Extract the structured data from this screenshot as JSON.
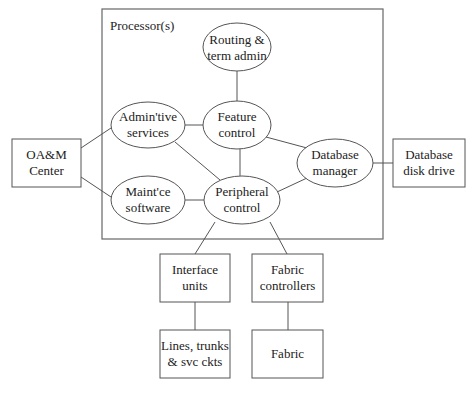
{
  "diagram": {
    "container": {
      "label": "Processor(s)"
    },
    "nodes": {
      "routing": {
        "line1": "Routing &",
        "line2": "term admin",
        "shape": "ellipse"
      },
      "admin": {
        "line1": "Admin'tive",
        "line2": "services",
        "shape": "ellipse"
      },
      "feature": {
        "line1": "Feature",
        "line2": "control",
        "shape": "ellipse"
      },
      "maint": {
        "line1": "Maint'ce",
        "line2": "software",
        "shape": "ellipse"
      },
      "peripheral": {
        "line1": "Peripheral",
        "line2": "control",
        "shape": "ellipse"
      },
      "dbmanager": {
        "line1": "Database",
        "line2": "manager",
        "shape": "ellipse"
      },
      "oam": {
        "line1": "OA&M",
        "line2": "Center",
        "shape": "box"
      },
      "diskdrive": {
        "line1": "Database",
        "line2": "disk drive",
        "shape": "box"
      },
      "interface": {
        "line1": "Interface",
        "line2": "units",
        "shape": "box"
      },
      "fabriccontrollers": {
        "line1": "Fabric",
        "line2": "controllers",
        "shape": "box"
      },
      "lines": {
        "line1": "Lines, trunks",
        "line2": "& svc ckts",
        "shape": "box"
      },
      "fabric": {
        "line1": "Fabric",
        "shape": "box"
      }
    },
    "edges": [
      [
        "routing",
        "feature"
      ],
      [
        "admin",
        "feature"
      ],
      [
        "admin",
        "peripheral"
      ],
      [
        "feature",
        "peripheral"
      ],
      [
        "feature",
        "dbmanager"
      ],
      [
        "maint",
        "peripheral"
      ],
      [
        "peripheral",
        "dbmanager"
      ],
      [
        "oam",
        "admin"
      ],
      [
        "oam",
        "maint"
      ],
      [
        "dbmanager",
        "diskdrive"
      ],
      [
        "peripheral",
        "interface"
      ],
      [
        "peripheral",
        "fabriccontrollers"
      ],
      [
        "interface",
        "lines"
      ],
      [
        "fabriccontrollers",
        "fabric"
      ]
    ]
  }
}
